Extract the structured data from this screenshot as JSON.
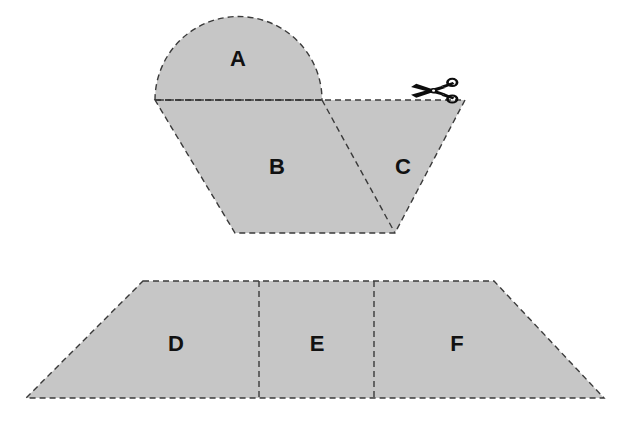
{
  "figure": {
    "background_color": "#ffffff",
    "fill_color": "#c6c6c6",
    "outline_color": "#3a3a3a",
    "label_color": "#111111",
    "dash_pattern": "6 4",
    "outline_width": 1.4
  },
  "top_figure": {
    "name": "source-shape",
    "description": "Semicircular cap on top of an isosceles trapezoid, divided by a diagonal cut into regions A, B and C",
    "semicircle": {
      "name": "region-a-semicircle",
      "center_x": 238.5,
      "center_y": 100,
      "radius": 83.5,
      "chord_left_x": 155,
      "chord_right_x": 322,
      "chord_y": 100
    },
    "trapezoid": {
      "name": "source-trapezoid",
      "top_left_x": 155,
      "top_right_x": 465,
      "top_y": 100,
      "bottom_left_x": 235,
      "bottom_right_x": 395,
      "bottom_y": 233
    },
    "cut_line": {
      "name": "diagonal-cut-line",
      "x1": 322,
      "y1": 100,
      "x2": 395,
      "y2": 233
    },
    "regions": [
      {
        "id": "A",
        "label": "A",
        "label_x": 238,
        "label_y": 60
      },
      {
        "id": "B",
        "label": "B",
        "label_x": 277,
        "label_y": 168
      },
      {
        "id": "C",
        "label": "C",
        "label_x": 403,
        "label_y": 168
      }
    ]
  },
  "scissors": {
    "name": "scissors-icon",
    "label": "scissors-icon",
    "x": 410,
    "y": 79,
    "width": 48,
    "height": 24,
    "color": "#0d0d0d",
    "description": "Scissors cutting along the top edge of the trapezoid"
  },
  "bottom_figure": {
    "name": "result-shape",
    "description": "Wide isosceles trapezoid divided into three regions D, E and F",
    "trapezoid": {
      "name": "result-trapezoid",
      "top_left_x": 143,
      "top_right_x": 494,
      "top_y": 281,
      "bottom_left_x": 26,
      "bottom_right_x": 604,
      "bottom_y": 398
    },
    "dividers": [
      {
        "name": "divider-d-e",
        "x": 259
      },
      {
        "name": "divider-e-f",
        "x": 374
      }
    ],
    "regions": [
      {
        "id": "D",
        "label": "D",
        "label_x": 176,
        "label_y": 345
      },
      {
        "id": "E",
        "label": "E",
        "label_x": 317,
        "label_y": 345
      },
      {
        "id": "F",
        "label": "F",
        "label_x": 457,
        "label_y": 345
      }
    ]
  }
}
